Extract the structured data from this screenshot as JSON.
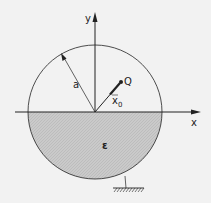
{
  "labels": {
    "y_axis": "y",
    "x_axis": "x",
    "radius": "a",
    "point": "Q",
    "vector": "x",
    "vector_sub": "0",
    "region": "ε"
  },
  "colors": {
    "background": "#f2f2f2",
    "line": "#222222",
    "fill": "#c8c8c8"
  }
}
